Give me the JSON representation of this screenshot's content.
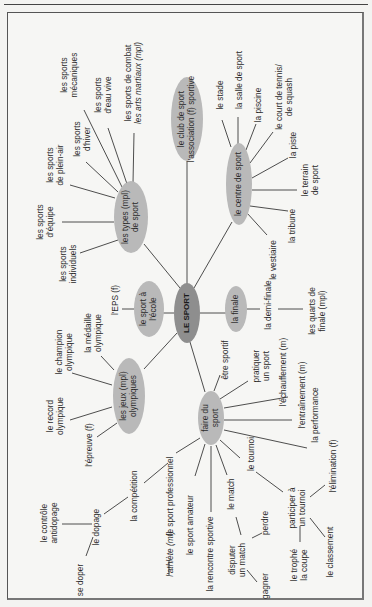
{
  "diagram": {
    "title": "LE SPORT",
    "colors": {
      "center_fill": "#8e8e8e",
      "node_fill": "#b9b9b9",
      "line": "#3a3a3a",
      "frame": "#555555"
    },
    "nodes": {
      "center": "LE SPORT",
      "types": {
        "line1": "les types (mpl)",
        "line2": "de sport"
      },
      "club": {
        "line1": "le club de sport",
        "line2": "l'association (f) sportive"
      },
      "centre": {
        "line1": "le centre de sport"
      },
      "ecole": {
        "line1": "le sport à",
        "line2": "l'école"
      },
      "finale": {
        "line1": "la finale"
      },
      "jeux": {
        "line1": "les jeux (mpl)",
        "line2": "olympiques"
      },
      "faire": {
        "line1": "faire du",
        "line2": "sport"
      }
    },
    "types_children": [
      {
        "l1": "les sports",
        "l2": "mécaniques"
      },
      {
        "l1": "les sports",
        "l2": "d'eau vive"
      },
      {
        "l1": "les sports de combat",
        "l2": "les arts martiaux (mpl)"
      },
      {
        "l1": "les sports",
        "l2": "d'hiver"
      },
      {
        "l1": "les sports",
        "l2": "de plein-air"
      },
      {
        "l1": "les sports",
        "l2": "d'équipe"
      },
      {
        "l1": "les sports",
        "l2": "individuels"
      }
    ],
    "centre_children": [
      {
        "l1": "le stade"
      },
      {
        "l1": "la salle de sport"
      },
      {
        "l1": "la piscine"
      },
      {
        "l1": "le court de tennis/",
        "l2": "de squash"
      },
      {
        "l1": "la piste"
      },
      {
        "l1": "le terrain",
        "l2": "de sport"
      },
      {
        "l1": "la tribune"
      },
      {
        "l1": "le vestiaire"
      }
    ],
    "ecole_children": [
      {
        "l1": "l'EPS (f)"
      }
    ],
    "finale_children": [
      {
        "l1": "la demi-finale"
      },
      {
        "l1": "les quarts de",
        "l2": "finale (mpl)"
      }
    ],
    "jeux_children": [
      {
        "l1": "la médaille",
        "l2": "olympique"
      },
      {
        "l1": "le champion",
        "l2": "olympique"
      },
      {
        "l1": "le record",
        "l2": "olympique"
      },
      {
        "l1": "l'épreuve (f)"
      }
    ],
    "faire_children": [
      {
        "l1": "être sportif"
      },
      {
        "l1": "pratiquer",
        "l2": "un sport"
      },
      {
        "l1": "l'échauffement (m)"
      },
      {
        "l1": "l'entraînement (m)"
      },
      {
        "l1": "la performance"
      },
      {
        "l1": "le tournoi"
      },
      {
        "l1": "le match"
      },
      {
        "l1": "la rencontre sportive"
      },
      {
        "l1": "le sport amateur"
      },
      {
        "l1": "le sport professionnel"
      }
    ],
    "sub_branches": {
      "competition": "la compétition",
      "dopage": "le dopage",
      "controle": {
        "l1": "le contrôle",
        "l2": "antidopage"
      },
      "se_doper": "se doper",
      "athlete": "l'athlète (mf)",
      "disputer": {
        "l1": "disputer",
        "l2": "un match"
      },
      "perdre": "perdre",
      "gagner": "gagner",
      "participer": {
        "l1": "participer à",
        "l2": "un tournoi"
      },
      "elimination": "l'élimination (f)",
      "classement": "le classement",
      "trophee": {
        "l1": "le trophé",
        "l2": "la coupe"
      }
    }
  }
}
